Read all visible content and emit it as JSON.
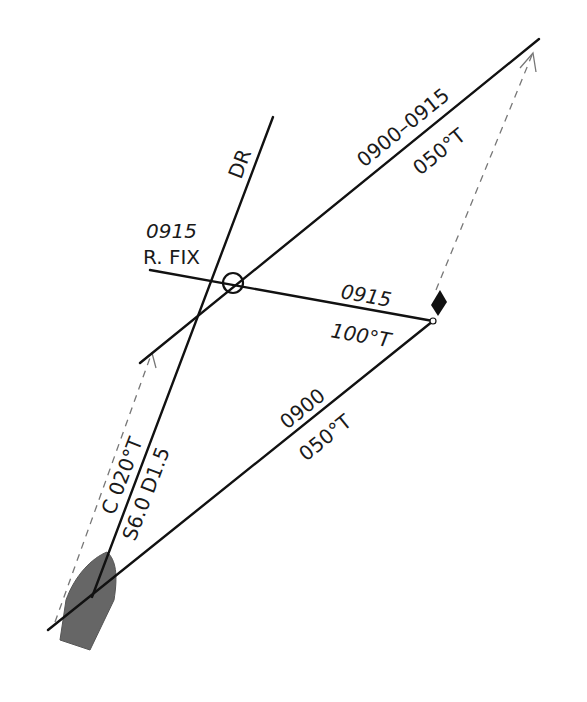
{
  "diagram": {
    "type": "running fix navigation plot",
    "colors": {
      "line": "#111111",
      "boat": "#666666",
      "dashed": "#777777",
      "marker": "#111111"
    },
    "labels": {
      "dr": "DR",
      "fix_time": "0915",
      "fix_type": "R. FIX",
      "lop1_time": "0900–0915",
      "lop1_bearing": "050°T",
      "lop2_time": "0915",
      "lop2_bearing": "100°T",
      "lop0_time": "0900",
      "lop0_bearing": "050°T",
      "course": "C 020°T",
      "speed_distance": "S6.0  D1.5"
    },
    "elements": [
      {
        "name": "boat",
        "shape": "hull",
        "color": "#666666"
      },
      {
        "name": "landmark",
        "shape": "black diamond with small circle"
      },
      {
        "name": "fix",
        "shape": "circle"
      }
    ]
  }
}
